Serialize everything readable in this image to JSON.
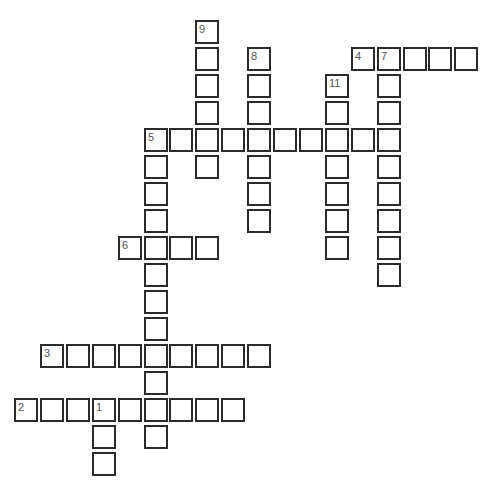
{
  "puzzle": {
    "type": "crossword",
    "grid_origin": {
      "x": 14,
      "y": 20
    },
    "col_pitch": 25.9,
    "row_pitch": 27,
    "cell_size": 24,
    "colors": {
      "border": "#2b2b2b",
      "number": "#555555",
      "background": "#ffffff"
    },
    "words": [
      {
        "number": "1",
        "direction": "down",
        "row": 14,
        "col": 3,
        "length": 3
      },
      {
        "number": "2",
        "direction": "across",
        "row": 14,
        "col": 0,
        "length": 9
      },
      {
        "number": "3",
        "direction": "across",
        "row": 12,
        "col": 1,
        "length": 9
      },
      {
        "number": "4",
        "direction": "across",
        "row": 1,
        "col": 13,
        "length": 5
      },
      {
        "number": "5",
        "direction": "across",
        "row": 4,
        "col": 5,
        "length": 10
      },
      {
        "number": "5",
        "direction": "down",
        "row": 4,
        "col": 5,
        "length": 12
      },
      {
        "number": "6",
        "direction": "across",
        "row": 8,
        "col": 4,
        "length": 4
      },
      {
        "number": "7",
        "direction": "down",
        "row": 1,
        "col": 14,
        "length": 9
      },
      {
        "number": "8",
        "direction": "down",
        "row": 1,
        "col": 9,
        "length": 7
      },
      {
        "number": "9",
        "direction": "down",
        "row": 0,
        "col": 7,
        "length": 6
      },
      {
        "number": "11",
        "direction": "down",
        "row": 2,
        "col": 12,
        "length": 7
      }
    ]
  }
}
